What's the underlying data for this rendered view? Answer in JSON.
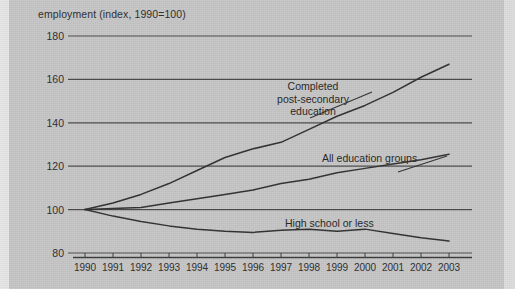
{
  "figure": {
    "background_color": "#c6c6c6",
    "line_color": "#2f2f2f",
    "grid_color": "#4a4a4a",
    "text_color": "#2b2b2b"
  },
  "chart_data": {
    "type": "line",
    "title": "employment (index, 1990=100)",
    "xlabel": "",
    "ylabel": "employment (index, 1990=100)",
    "ylim": [
      80,
      180
    ],
    "xlim": [
      1990,
      2003
    ],
    "yticks": [
      180,
      160,
      140,
      120,
      100,
      80
    ],
    "grid": "horizontal",
    "legend_position": "inline-annotations",
    "x": [
      1990,
      1991,
      1992,
      1993,
      1994,
      1995,
      1996,
      1997,
      1998,
      1999,
      2000,
      2001,
      2002,
      2003
    ],
    "categories": [
      "1990",
      "1991",
      "1992",
      "1993",
      "1994",
      "1995",
      "1996",
      "1997",
      "1998",
      "1999",
      "2000",
      "2001",
      "2002",
      "2003"
    ],
    "series": [
      {
        "name": "Completed post-secondary education",
        "label_lines": [
          "Completed",
          "post-secondary",
          "education"
        ],
        "values": [
          100,
          103,
          107,
          112,
          118,
          124,
          128,
          131,
          137,
          143,
          148,
          154,
          161,
          167
        ]
      },
      {
        "name": "All education groups",
        "label_lines": [
          "All education groups"
        ],
        "values": [
          100,
          100.5,
          101,
          103,
          105,
          107,
          109,
          112,
          114,
          117,
          119,
          121,
          123,
          125.5
        ]
      },
      {
        "name": "High school or less",
        "label_lines": [
          "High school or less"
        ],
        "values": [
          100,
          97,
          94.5,
          92.5,
          91,
          90,
          89.5,
          90.5,
          91,
          90,
          91,
          89,
          87,
          85.5
        ]
      }
    ],
    "annotations": [
      {
        "text": "Completed post-secondary education",
        "leader_line": true
      },
      {
        "text": "All education groups",
        "leader_line": true
      },
      {
        "text": "High school or less",
        "leader_line": false
      }
    ]
  }
}
